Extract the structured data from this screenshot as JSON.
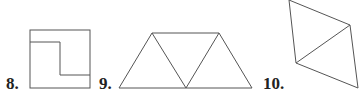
{
  "figures": [
    {
      "number": "8.",
      "shape": "square-divided-by-step-line"
    },
    {
      "number": "9.",
      "shape": "trapezoid-of-three-triangles"
    },
    {
      "number": "10.",
      "shape": "rhombus-split-into-two-triangles"
    }
  ],
  "colors": {
    "stroke": "#555555",
    "text": "#222222"
  }
}
